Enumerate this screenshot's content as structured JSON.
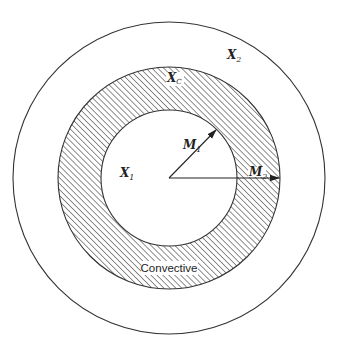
{
  "diagram": {
    "type": "concentric-circles",
    "colors": {
      "stroke": "#333333",
      "hatch": "#333333",
      "background": "#ffffff",
      "text": "#222222"
    },
    "center": {
      "x": 169,
      "y": 178
    },
    "regions": [
      {
        "id": "inner-core",
        "label_main": "X",
        "label_sub": "1",
        "radius": 68,
        "fill": "none"
      },
      {
        "id": "convective-shell",
        "label_main": "X",
        "label_sub": "C",
        "radius": 111,
        "fill": "hatched"
      },
      {
        "id": "outer-envelope",
        "label_main": "X",
        "label_sub": "2",
        "radius": 156,
        "fill": "none"
      }
    ],
    "arrows": [
      {
        "id": "m1",
        "label_main": "M",
        "label_sub": "1",
        "to": {
          "x": 216,
          "y": 130
        }
      },
      {
        "id": "m2",
        "label_main": "M",
        "label_sub": "2",
        "to": {
          "x": 279,
          "y": 178
        }
      }
    ],
    "convective_label": "Convective"
  }
}
